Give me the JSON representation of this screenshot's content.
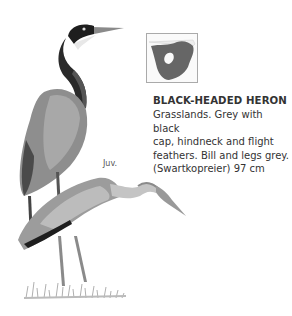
{
  "species": {
    "title": "BLACK-HEADED HERON",
    "description": "Grasslands. Grey with black cap, hindneck and flight feathers. Bill and legs grey. (Swartkopreier) 97 cm",
    "description_lines": [
      "Grasslands. Grey with black",
      "cap, hindneck and flight",
      "feathers. Bill and legs grey.",
      "(Swartkopreier) 97 cm"
    ]
  },
  "illustration": {
    "juvenile_label": "Juv."
  },
  "map": {
    "range_color": "#666666"
  }
}
